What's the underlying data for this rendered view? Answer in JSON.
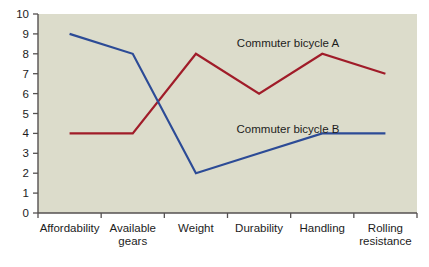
{
  "chart_data": {
    "type": "line",
    "title": "",
    "xlabel": "",
    "ylabel": "",
    "ylim": [
      0,
      10
    ],
    "ytick_step": 1,
    "grid": false,
    "legend_position": "inline-annotation",
    "background_color": "#dcdccb",
    "page_background": "#ffffff",
    "categories": [
      "Affordability",
      "Available gears",
      "Weight",
      "Durability",
      "Handling",
      "Rolling resistance"
    ],
    "category_lines": [
      [
        "Affordability"
      ],
      [
        "Available",
        "gears"
      ],
      [
        "Weight"
      ],
      [
        "Durability"
      ],
      [
        "Handling"
      ],
      [
        "Rolling",
        "resistance"
      ]
    ],
    "ytick_labels": [
      "0",
      "1",
      "2",
      "3",
      "4",
      "5",
      "6",
      "7",
      "8",
      "9",
      "10"
    ],
    "series": [
      {
        "name": "Commuter bicycle A",
        "color": "#a01c29",
        "values": [
          4,
          4,
          8,
          6,
          8,
          7
        ],
        "label_anchor": {
          "x": 288,
          "y": 47
        }
      },
      {
        "name": "Commuter bicycle B",
        "color": "#2c4b96",
        "values": [
          9,
          8,
          2,
          3,
          4,
          4
        ],
        "label_anchor": {
          "x": 288,
          "y": 133
        }
      }
    ]
  },
  "axis": {
    "line_color": "#555151",
    "tick_color": "#555151"
  }
}
